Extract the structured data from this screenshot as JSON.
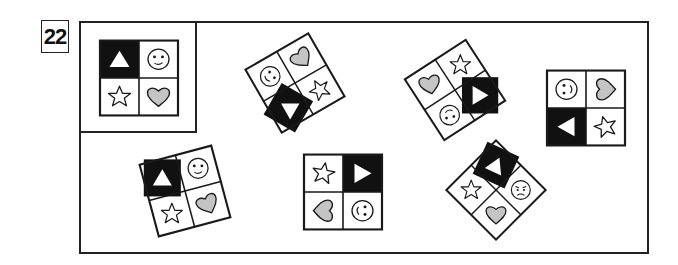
{
  "question": {
    "number": "22"
  },
  "colors": {
    "line": "#1a1a1a",
    "black_cell": "#111111",
    "heart_fill": "#c4c4c4",
    "white": "#ffffff"
  },
  "reference": {
    "label": "reference pattern",
    "cells": {
      "top_left": "black-up-triangle",
      "top_right": "smiley-face",
      "bottom_left": "star",
      "bottom_right": "heart"
    }
  },
  "options": [
    {
      "id": "A",
      "rotation_deg": -30,
      "cells": {
        "top_left": "black-up-triangle",
        "top_right": "smiley-face",
        "bottom_left": "star",
        "bottom_right": "heart"
      }
    },
    {
      "id": "B",
      "rotation_deg": -35,
      "cells": {
        "top_left": "heart",
        "top_right": "star",
        "bottom_left": "smiley-face",
        "bottom_right": "black-right-triangle"
      }
    },
    {
      "id": "C",
      "rotation_deg": 0,
      "cells": {
        "top_left": "smiley-face",
        "top_right": "heart",
        "bottom_left": "black-left-triangle",
        "bottom_right": "star"
      }
    },
    {
      "id": "D",
      "rotation_deg": -15,
      "cells": {
        "top_left": "black-up-triangle",
        "top_right": "smiley-face",
        "bottom_left": "star",
        "bottom_right": "heart"
      }
    },
    {
      "id": "E",
      "rotation_deg": 0,
      "cells": {
        "top_left": "star",
        "top_right": "black-right-triangle",
        "bottom_left": "heart",
        "bottom_right": "smiley-face"
      }
    },
    {
      "id": "F",
      "rotation_deg": 45,
      "cells": {
        "top_left": "black-up-triangle",
        "top_right": "frowning-face",
        "bottom_left": "star",
        "bottom_right": "heart"
      }
    }
  ]
}
